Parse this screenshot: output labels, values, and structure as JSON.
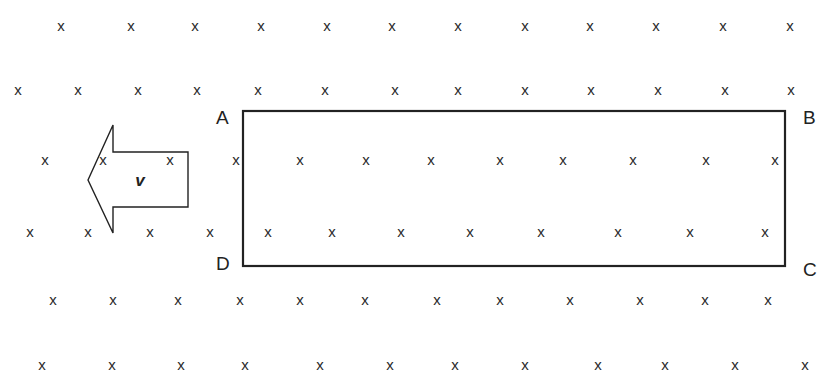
{
  "diagram": {
    "field": {
      "symbol": "x",
      "meaning": "magnetic field into the page",
      "rows": [
        {
          "y": 26,
          "xs": [
            61,
            131,
            195,
            261,
            327,
            392,
            458,
            525,
            590,
            656,
            723,
            790
          ]
        },
        {
          "y": 90,
          "xs": [
            18,
            78,
            138,
            197,
            258,
            325,
            395,
            458,
            525,
            591,
            658,
            725,
            791
          ]
        },
        {
          "y": 160,
          "xs": [
            45,
            103,
            170,
            236,
            300,
            366,
            431,
            500,
            563,
            633,
            706,
            775
          ]
        },
        {
          "y": 232,
          "xs": [
            30,
            88,
            150,
            210,
            268,
            332,
            401,
            470,
            541,
            618,
            690,
            765
          ]
        },
        {
          "y": 300,
          "xs": [
            53,
            113,
            178,
            240,
            300,
            365,
            437,
            500,
            570,
            640,
            705,
            768
          ]
        },
        {
          "y": 365,
          "xs": [
            42,
            112,
            181,
            245,
            320,
            390,
            455,
            525,
            598,
            665,
            735,
            805
          ]
        }
      ]
    },
    "loop": {
      "x": 243,
      "y": 111,
      "width": 542,
      "height": 155,
      "stroke": "#222222",
      "corners": {
        "A": {
          "label": "A",
          "x": 216,
          "y": 124
        },
        "B": {
          "label": "B",
          "x": 803,
          "y": 124
        },
        "C": {
          "label": "C",
          "x": 803,
          "y": 276
        },
        "D": {
          "label": "D",
          "x": 216,
          "y": 270
        }
      }
    },
    "velocity_arrow": {
      "label": "v",
      "direction": "left",
      "points": "88,180 113,125 113,152 188,152 188,207 113,207 113,233"
    },
    "colors": {
      "background": "#ffffff",
      "ink": "#222222"
    }
  }
}
